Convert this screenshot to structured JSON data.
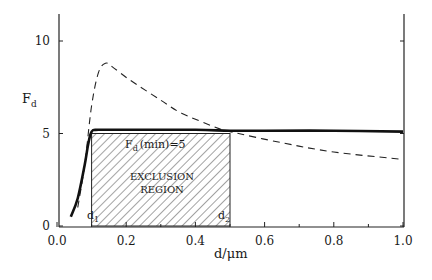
{
  "chart_data": {
    "type": "line",
    "title": "",
    "xlabel": "d/μm",
    "ylabel": "F",
    "ylabel_sub": "d",
    "xlim": [
      0.0,
      1.0
    ],
    "ylim": [
      0,
      11.5
    ],
    "grid": false,
    "legend": null,
    "x_ticks": [
      "0.0",
      "0.2",
      "0.4",
      "0.6",
      "0.8",
      "1.0"
    ],
    "y_ticks": [
      "0",
      "5",
      "10"
    ],
    "series": [
      {
        "name": "solid",
        "style": "solid-bold",
        "x": [
          0.04,
          0.06,
          0.08,
          0.09,
          0.1,
          0.12,
          0.2,
          0.4,
          0.5,
          0.6,
          0.8,
          1.0
        ],
        "y": [
          0.5,
          1.5,
          3.3,
          4.4,
          5.1,
          5.2,
          5.2,
          5.2,
          5.15,
          5.15,
          5.15,
          5.1
        ]
      },
      {
        "name": "dashed",
        "style": "dashed",
        "x": [
          0.06,
          0.08,
          0.1,
          0.12,
          0.14,
          0.16,
          0.21,
          0.3,
          0.36,
          0.47,
          0.5,
          0.65,
          0.8,
          1.0
        ],
        "y": [
          1.0,
          3.3,
          6.5,
          8.3,
          8.8,
          8.6,
          7.9,
          6.8,
          6.1,
          5.25,
          5.1,
          4.5,
          4.0,
          3.6
        ]
      }
    ],
    "shaded_region": {
      "label_line1": "EXCLUSION",
      "label_line2": "REGION",
      "x_range": [
        0.1,
        0.5
      ],
      "y_range": [
        0,
        5
      ],
      "fill": "diagonal-hatch"
    },
    "annotations": {
      "fmin_main": "F",
      "fmin_sub": "d",
      "fmin_rest": "(min)=5",
      "d1_main": "d",
      "d1_sub": "1",
      "d2_main": "d",
      "d2_sub": "2"
    }
  }
}
